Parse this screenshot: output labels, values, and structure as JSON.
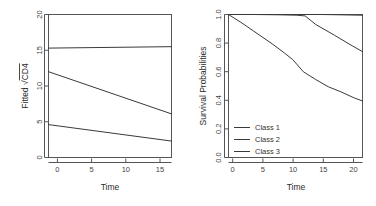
{
  "figure": {
    "background": "#ffffff",
    "line_color": "#3a3a3a",
    "axis_color": "#555555",
    "panels": 2
  },
  "chart_data": [
    {
      "type": "line",
      "panel": "left",
      "title": "",
      "xlabel": "Time",
      "ylabel": "Fitted √CD4",
      "ylabel_parts": {
        "prefix": "Fitted ",
        "radical": "√",
        "radicand": "CD4"
      },
      "xlim": [
        0,
        18
      ],
      "ylim": [
        0,
        20
      ],
      "xticks": [
        0,
        5,
        10,
        15
      ],
      "xticklabels": [
        "0",
        "5",
        "10",
        "15"
      ],
      "yticks": [
        0,
        5,
        10,
        15,
        20
      ],
      "yticklabels": [
        "0",
        "5",
        "10",
        "15",
        "20"
      ],
      "grid": false,
      "legend": null,
      "x": [
        0,
        18
      ],
      "series": [
        {
          "name": "Class 1",
          "values": [
            15.3,
            15.5
          ]
        },
        {
          "name": "Class 2",
          "values": [
            12.0,
            6.1
          ]
        },
        {
          "name": "Class 3",
          "values": [
            4.6,
            2.3
          ]
        }
      ]
    },
    {
      "type": "line",
      "panel": "right",
      "title": "",
      "xlabel": "Time",
      "ylabel": "Survival Probabilities",
      "xlim": [
        0,
        21.5
      ],
      "ylim": [
        0.0,
        1.0
      ],
      "xticks": [
        0,
        5,
        10,
        15,
        20
      ],
      "xticklabels": [
        "0",
        "5",
        "10",
        "15",
        "20"
      ],
      "yticks": [
        0.0,
        0.2,
        0.4,
        0.6,
        0.8,
        1.0
      ],
      "yticklabels": [
        "0.0",
        "0.2",
        "0.4",
        "0.6",
        "0.8",
        "1.0"
      ],
      "grid": false,
      "legend": {
        "position": "bottom-left",
        "entries": [
          "Class 1",
          "Class 2",
          "Class 3"
        ]
      },
      "series": [
        {
          "name": "Class 1",
          "x": [
            0,
            5,
            10,
            15,
            21.5
          ],
          "values": [
            1.0,
            1.0,
            1.0,
            1.0,
            0.995
          ]
        },
        {
          "name": "Class 2",
          "x": [
            0,
            4,
            8,
            11,
            12.3,
            14,
            17,
            19.5,
            21.5
          ],
          "values": [
            1.0,
            1.0,
            0.998,
            0.995,
            0.99,
            0.93,
            0.855,
            0.79,
            0.74
          ]
        },
        {
          "name": "Class 3",
          "x": [
            0,
            2,
            4,
            7,
            9,
            10.3,
            12,
            14,
            16,
            18,
            20,
            21.5
          ],
          "values": [
            1.0,
            0.945,
            0.885,
            0.795,
            0.73,
            0.685,
            0.6,
            0.545,
            0.495,
            0.46,
            0.42,
            0.395
          ]
        }
      ]
    }
  ],
  "left_panel": {
    "xlabel": "Time",
    "ylabel_prefix": "Fitted ",
    "ylabel_radical": "√",
    "ylabel_radicand": "CD4",
    "xticklabels": [
      "0",
      "5",
      "10",
      "15"
    ],
    "yticklabels": [
      "0",
      "5",
      "10",
      "15",
      "20"
    ]
  },
  "right_panel": {
    "xlabel": "Time",
    "ylabel": "Survival Probabilities",
    "xticklabels": [
      "0",
      "5",
      "10",
      "15",
      "20"
    ],
    "yticklabels": [
      "0.0",
      "0.2",
      "0.4",
      "0.6",
      "0.8",
      "1.0"
    ],
    "legend": {
      "item1": "Class 1",
      "item2": "Class 2",
      "item3": "Class 3"
    }
  }
}
